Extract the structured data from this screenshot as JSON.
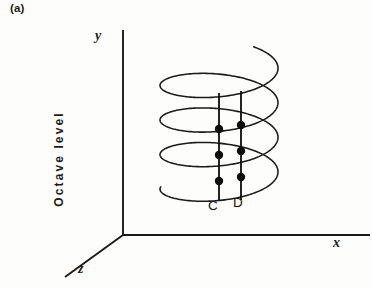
{
  "figure": {
    "panel_label": "(a)",
    "background_color": "#fdfdfc",
    "ink_color": "#1a1a1a",
    "axes": {
      "y_label": "y",
      "x_label": "x",
      "z_label": "z",
      "vertical_axis_title": "Octave level"
    },
    "annotations": {
      "note_c": "C",
      "note_d": "D"
    }
  },
  "chart_data": {
    "type": "line",
    "title": "",
    "subtitle": "",
    "xlabel": "x",
    "ylabel": "Octave level",
    "zlabel": "z",
    "grid": false,
    "legend": null,
    "projection": "3d-oblique",
    "origin_px": [
      123,
      235
    ],
    "axis_segments": [
      {
        "name": "y-axis",
        "from_px": [
          123,
          235
        ],
        "to_px": [
          123,
          30
        ]
      },
      {
        "name": "x-axis",
        "from_px": [
          123,
          235
        ],
        "to_px": [
          370,
          235
        ]
      },
      {
        "name": "z-axis",
        "from_px": [
          123,
          235
        ],
        "to_px": [
          65,
          277
        ]
      }
    ],
    "helix": {
      "turns": 3,
      "center_x_px": 219,
      "ellipse_rx_px": 59,
      "ellipse_ry_px": 20,
      "top_y_px": 63,
      "bottom_y_px": 190,
      "stroke_width": 1.5
    },
    "series": [
      {
        "name": "C",
        "label": "C",
        "line_x_px": 219,
        "line_top_y_px": 93,
        "line_bottom_y_px": 200,
        "octaves": [
          1,
          2,
          3
        ],
        "points_px": [
          [
            219,
            129
          ],
          [
            219,
            155
          ],
          [
            219,
            181
          ]
        ]
      },
      {
        "name": "D",
        "label": "D",
        "line_x_px": 241,
        "line_top_y_px": 91,
        "line_bottom_y_px": 200,
        "octaves": [
          1,
          2,
          3
        ],
        "points_px": [
          [
            241,
            125
          ],
          [
            241,
            151
          ],
          [
            241,
            177
          ]
        ]
      }
    ],
    "marker": {
      "shape": "filled-circle",
      "radius_px": 4.2,
      "color": "#0d0d0d"
    }
  }
}
